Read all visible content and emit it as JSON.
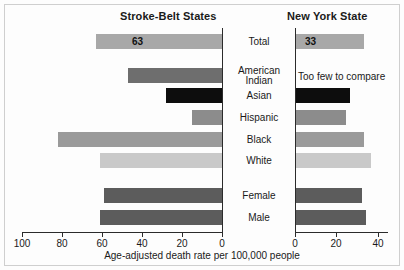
{
  "chart_data": {
    "type": "bar",
    "orientation": "horizontal",
    "title": "",
    "xlabel": "Age-adjusted death rate per 100,000 people",
    "ylabel": "",
    "grid": false,
    "legend": "none",
    "panels": [
      {
        "name": "left",
        "title": "Stroke-Belt States",
        "direction": "leftward",
        "xlim": [
          0,
          100
        ],
        "ticks": [
          100,
          80,
          60,
          40,
          20,
          0
        ],
        "tick_labels": [
          "100",
          "80",
          "60",
          "40",
          "20",
          "0"
        ]
      },
      {
        "name": "right",
        "title": "New York State",
        "direction": "rightward",
        "xlim": [
          0,
          45
        ],
        "ticks": [
          0,
          20,
          40
        ],
        "tick_labels": [
          "0",
          "20",
          "40"
        ]
      }
    ],
    "categories": [
      "Total",
      "American Indian",
      "Asian",
      "Hispanic",
      "Black",
      "White",
      "Female",
      "Male"
    ],
    "series": [
      {
        "name": "Stroke-Belt States",
        "values": [
          63,
          47,
          28,
          15,
          82,
          61,
          59,
          61
        ]
      },
      {
        "name": "New York State",
        "values": [
          33,
          null,
          26,
          24,
          33,
          36,
          32,
          34
        ]
      }
    ],
    "annotations": [
      {
        "panel": "right",
        "category": "American Indian",
        "text": "Too few to compare"
      }
    ],
    "data_labels": [
      {
        "panel": "left",
        "category": "Total",
        "text": "63"
      },
      {
        "panel": "right",
        "category": "Total",
        "text": "33"
      }
    ]
  },
  "rows": [
    {
      "label_lines": [
        "Total"
      ],
      "left_value": 63,
      "left_value_text": "63",
      "left_color": "#a8a8a8",
      "right_value": 33,
      "right_value_text": "33",
      "right_color": "#a8a8a8",
      "right_note": "",
      "top": 32
    },
    {
      "label_lines": [
        "American",
        "Indian"
      ],
      "left_value": 47,
      "left_value_text": "",
      "left_color": "#6e6e6e",
      "right_value": null,
      "right_value_text": "",
      "right_color": "",
      "right_note": "Too few to compare",
      "top": 66
    },
    {
      "label_lines": [
        "Asian"
      ],
      "left_value": 28,
      "left_value_text": "",
      "left_color": "#0d0d0d",
      "right_value": 26,
      "right_value_text": "",
      "right_color": "#0d0d0d",
      "right_note": "",
      "top": 86
    },
    {
      "label_lines": [
        "Hispanic"
      ],
      "left_value": 15,
      "left_value_text": "",
      "left_color": "#8c8c8c",
      "right_value": 24,
      "right_value_text": "",
      "right_color": "#8c8c8c",
      "right_note": "",
      "top": 108
    },
    {
      "label_lines": [
        "Black"
      ],
      "left_value": 82,
      "left_value_text": "",
      "left_color": "#9a9a9a",
      "right_value": 33,
      "right_value_text": "",
      "right_color": "#9a9a9a",
      "right_note": "",
      "top": 130
    },
    {
      "label_lines": [
        "White"
      ],
      "left_value": 61,
      "left_value_text": "",
      "left_color": "#c9c9c9",
      "right_value": 36,
      "right_value_text": "",
      "right_color": "#c9c9c9",
      "right_note": "",
      "top": 151
    },
    {
      "label_lines": [
        "Female"
      ],
      "left_value": 59,
      "left_value_text": "",
      "left_color": "#5c5c5c",
      "right_value": 32,
      "right_value_text": "",
      "right_color": "#5c5c5c",
      "right_note": "",
      "top": 186
    },
    {
      "label_lines": [
        "Male"
      ],
      "left_value": 61,
      "left_value_text": "",
      "left_color": "#5c5c5c",
      "right_value": 34,
      "right_value_text": "",
      "right_color": "#5c5c5c",
      "right_note": "",
      "top": 208
    }
  ],
  "axis": {
    "left_ticks": [
      {
        "label": "100",
        "x": 22
      },
      {
        "label": "80",
        "x": 62
      },
      {
        "label": "60",
        "x": 102
      },
      {
        "label": "40",
        "x": 142
      },
      {
        "label": "20",
        "x": 182
      },
      {
        "label": "0",
        "x": 222
      }
    ],
    "right_ticks": [
      {
        "label": "0",
        "x": 295
      },
      {
        "label": "20",
        "x": 336
      },
      {
        "label": "40",
        "x": 378
      }
    ]
  },
  "titles": {
    "left": "Stroke-Belt States",
    "right": "New York State"
  },
  "xlabel": "Age-adjusted death rate per 100,000 people"
}
